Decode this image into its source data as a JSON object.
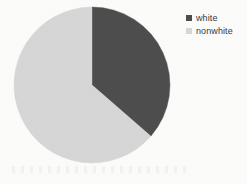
{
  "figure": {
    "background_color": "#fbfbfa"
  },
  "chart_data": {
    "type": "pie",
    "title": "",
    "subtitle": "",
    "xlabel": "",
    "ylabel": "",
    "grid": false,
    "categories": [
      "white",
      "nonwhite"
    ],
    "values": [
      36.4,
      63.6
    ],
    "units": "percent",
    "colors": [
      "#4d4d4d",
      "#d6d6d6"
    ],
    "start_angle_deg": 0,
    "direction": "clockwise",
    "slices": [
      {
        "label": "white",
        "value": 36.4,
        "color": "#4d4d4d",
        "start_angle_deg": 0,
        "end_angle_deg": 131
      },
      {
        "label": "nonwhite",
        "value": 63.6,
        "color": "#d6d6d6",
        "start_angle_deg": 131,
        "end_angle_deg": 360
      }
    ],
    "legend": {
      "position": "right",
      "entries": [
        {
          "label": "white",
          "color": "#4d4d4d"
        },
        {
          "label": "nonwhite",
          "color": "#d6d6d6"
        }
      ]
    },
    "geometry": {
      "center_x": 92,
      "center_y": 85,
      "radius": 78
    }
  }
}
